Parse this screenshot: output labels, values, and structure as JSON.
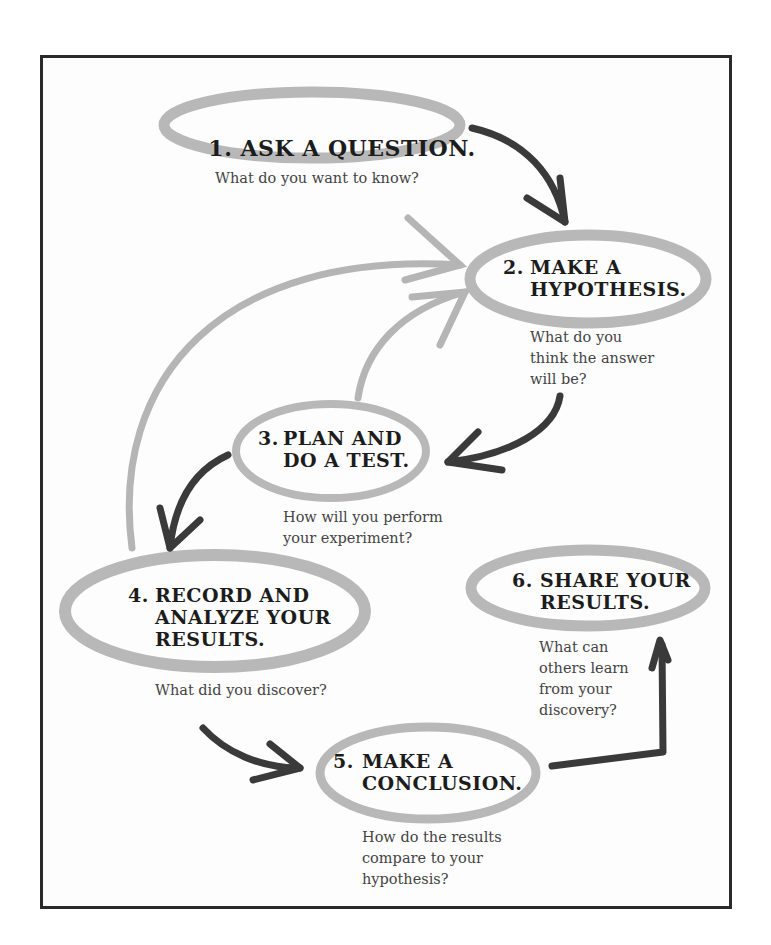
{
  "diagram": {
    "type": "scientific-method-cycle",
    "steps": [
      {
        "number": "1.",
        "title": "ASK A QUESTION.",
        "question": "What do you want to know?"
      },
      {
        "number": "2.",
        "title": "MAKE A\nHYPOTHESIS.",
        "question": "What do you\nthink the answer\nwill be?"
      },
      {
        "number": "3.",
        "title": "PLAN AND\nDO A TEST.",
        "question": "How will you perform\nyour experiment?"
      },
      {
        "number": "4.",
        "title": "RECORD AND\nANALYZE YOUR\nRESULTS.",
        "question": "What did you discover?"
      },
      {
        "number": "5.",
        "title": "MAKE A\nCONCLUSION.",
        "question": "How do the results\ncompare to your\nhypothesis?"
      },
      {
        "number": "6.",
        "title": "SHARE YOUR\nRESULTS.",
        "question": "What can\nothers learn\nfrom your\ndiscovery?"
      }
    ],
    "arrows": [
      {
        "from": "1",
        "to": "2",
        "style": "dark"
      },
      {
        "from": "2",
        "to": "3",
        "style": "dark"
      },
      {
        "from": "3",
        "to": "4",
        "style": "dark"
      },
      {
        "from": "3",
        "to": "2",
        "style": "light"
      },
      {
        "from": "4",
        "to": "2",
        "style": "light"
      },
      {
        "from": "4",
        "to": "5",
        "style": "dark"
      },
      {
        "from": "5",
        "to": "6",
        "style": "dark"
      }
    ],
    "colors": {
      "dark_arrow": "#3a3a3a",
      "light_arrow": "#b5b5b5",
      "ellipse": "#b8b8b8",
      "border": "#2a2a2a",
      "text": "#1c1c1c"
    }
  }
}
